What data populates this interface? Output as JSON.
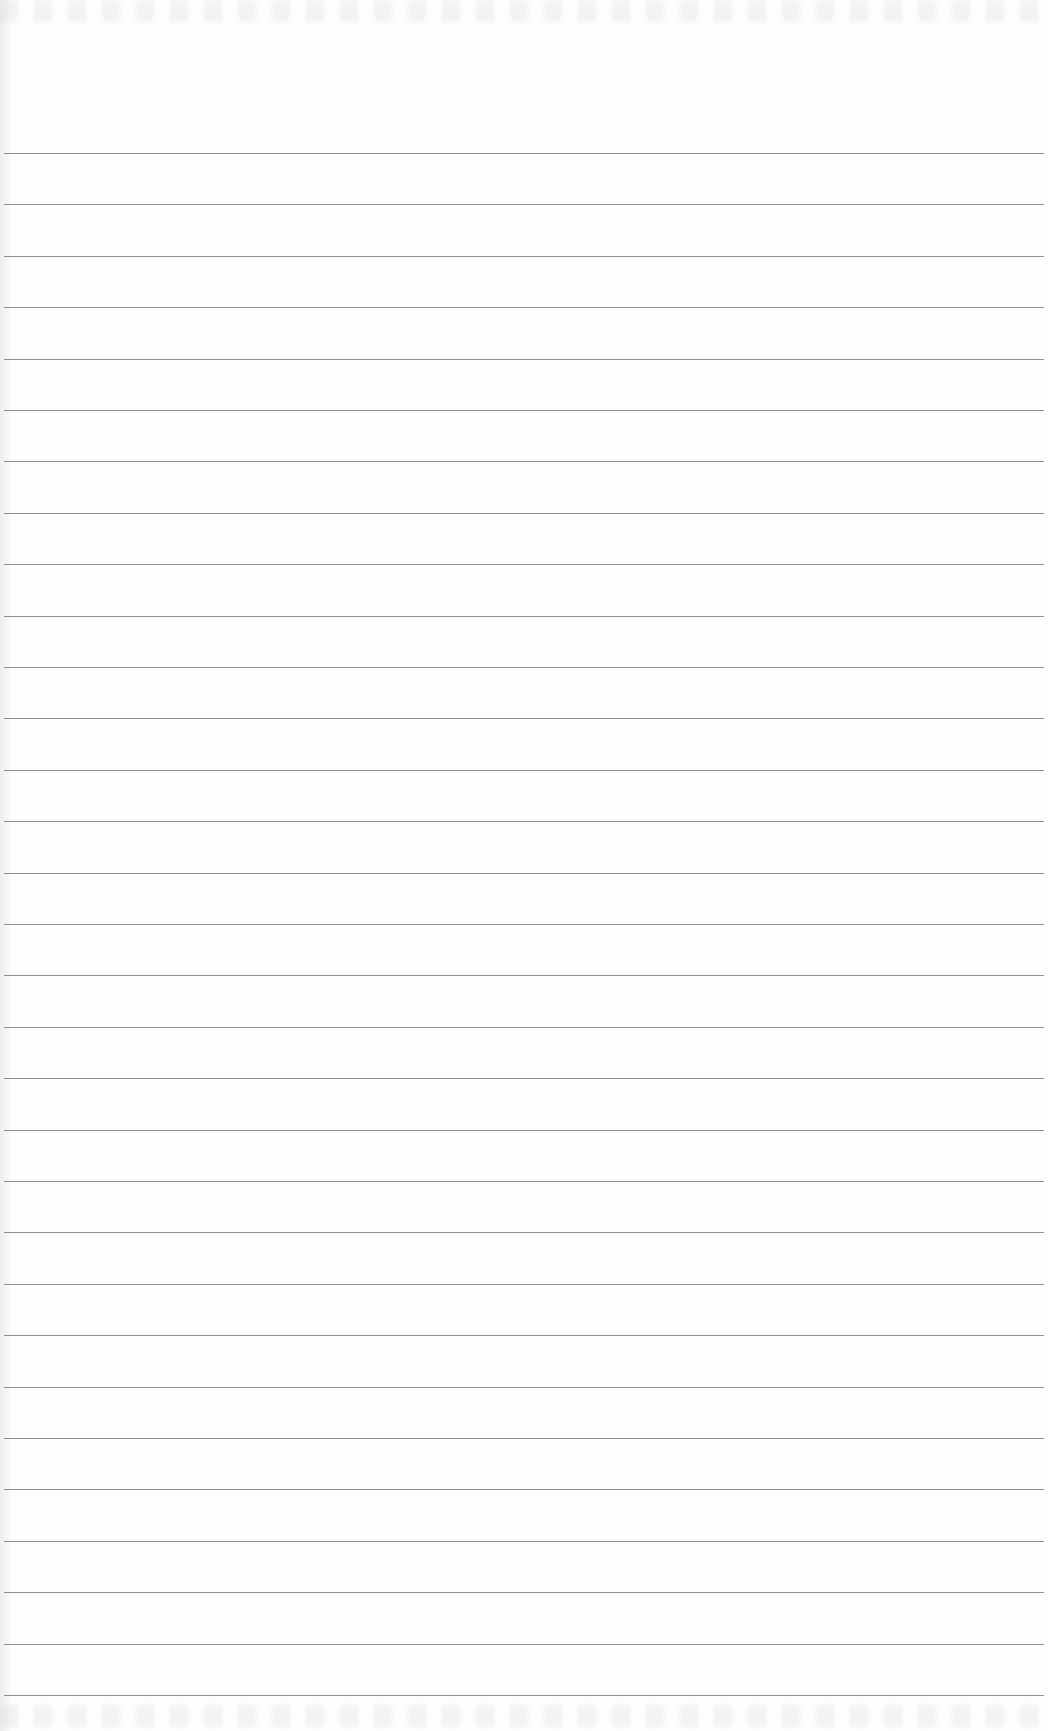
{
  "document": {
    "type": "ruled-paper",
    "text": "",
    "line_count": 31,
    "first_line_y": 153,
    "line_spacing_px": 51.4,
    "line_color": "#7d7d7d",
    "paper_color": "#fdfdfd"
  }
}
